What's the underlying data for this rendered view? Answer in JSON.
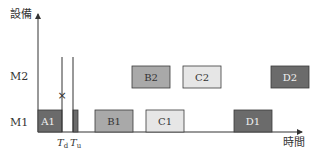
{
  "axes": {
    "y_label": "設備",
    "x_label": "時間",
    "rows": [
      {
        "id": "M2",
        "label": "M2"
      },
      {
        "id": "M1",
        "label": "M1"
      }
    ]
  },
  "markers": {
    "td": {
      "main": "T",
      "sub": "d"
    },
    "tu": {
      "main": "T",
      "sub": "u"
    },
    "failure_symbol": "×"
  },
  "tasks": [
    {
      "id": "A1",
      "label": "A1",
      "row": "M1",
      "shade": "dark"
    },
    {
      "id": "B1",
      "label": "B1",
      "row": "M1",
      "shade": "mid"
    },
    {
      "id": "C1",
      "label": "C1",
      "row": "M1",
      "shade": "light"
    },
    {
      "id": "D1",
      "label": "D1",
      "row": "M1",
      "shade": "dark"
    },
    {
      "id": "B2",
      "label": "B2",
      "row": "M2",
      "shade": "mid"
    },
    {
      "id": "C2",
      "label": "C2",
      "row": "M2",
      "shade": "light"
    },
    {
      "id": "D2",
      "label": "D2",
      "row": "M2",
      "shade": "dark"
    }
  ],
  "colors": {
    "dark": "#6b6b6b",
    "mid": "#a9a9a9",
    "light": "#e6e6e6",
    "border": "#3a3a3a",
    "axis": "#333333",
    "text_on_dark": "#f2f2f2",
    "text_on_light": "#333333"
  }
}
